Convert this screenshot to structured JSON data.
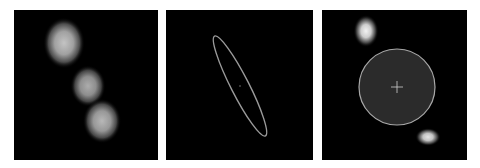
{
  "figure": {
    "panels": [
      {
        "id": "panel-1",
        "description": "Pixelated intensity image with three bright blobs along a diagonal",
        "background": "#000000",
        "blobs": [
          {
            "cx": 50,
            "cy": 33,
            "rx": 13,
            "ry": 16,
            "intensity": 0.85
          },
          {
            "cx": 74,
            "cy": 76,
            "rx": 11,
            "ry": 13,
            "intensity": 0.75
          },
          {
            "cx": 88,
            "cy": 111,
            "rx": 12,
            "ry": 14,
            "intensity": 0.8
          }
        ]
      },
      {
        "id": "panel-2",
        "description": "Thin elongated ellipse outline with faint center point",
        "background": "#000000",
        "ellipse": {
          "cx": 74,
          "cy": 76,
          "rx": 9,
          "ry": 56,
          "rotation": -27,
          "stroke": "#9a9a9a"
        },
        "center_dot": {
          "cx": 74,
          "cy": 76
        }
      },
      {
        "id": "panel-3",
        "description": "Dark filled circle with crosshair marker between two bright blobs",
        "background": "#000000",
        "circle": {
          "cx": 75,
          "cy": 77,
          "r": 38,
          "fill": "#2b2b2b",
          "stroke": "#a8a8a8"
        },
        "crosshair": {
          "cx": 75,
          "cy": 77,
          "size": 6,
          "color": "#cfcfcf"
        },
        "blobs": [
          {
            "cx": 44,
            "cy": 21,
            "rx": 7,
            "ry": 9,
            "intensity": 0.95
          },
          {
            "cx": 106,
            "cy": 127,
            "rx": 7,
            "ry": 5,
            "intensity": 0.9
          }
        ]
      }
    ]
  }
}
